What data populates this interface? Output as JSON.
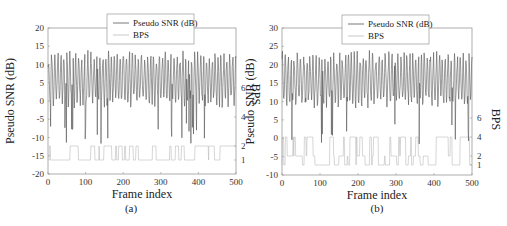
{
  "chart_data": [
    {
      "type": "line",
      "caption": "(a)",
      "xlabel": "Frame index",
      "ylabel": "Pseudo SNR (dB)",
      "ylabel_right": "BPS",
      "xlim": [
        0,
        500
      ],
      "ylim": [
        -20,
        20
      ],
      "xticks": [
        0,
        100,
        200,
        300,
        400,
        500
      ],
      "yticks": [
        -20,
        -15,
        -10,
        -5,
        0,
        5,
        10,
        15,
        20
      ],
      "yticks_right": [
        1,
        2,
        4,
        6
      ],
      "grid": false,
      "legend": {
        "position": "top-center",
        "entries": [
          "Pseudo SNR (dB)",
          "BPS"
        ]
      },
      "series": [
        {
          "name": "Pseudo SNR (dB)",
          "color": "#555555",
          "range": [
            -12,
            16
          ],
          "mean": 6
        },
        {
          "name": "BPS",
          "color": "#bbbbbb",
          "values_set": [
            1,
            2
          ],
          "note": "mostly 1, occasional bursts to 2"
        }
      ]
    },
    {
      "type": "line",
      "caption": "(b)",
      "xlabel": "Frame index",
      "ylabel": "Pseudo SNR (dB)",
      "ylabel_right": "BPS",
      "xlim": [
        0,
        500
      ],
      "ylim": [
        -10,
        30
      ],
      "xticks": [
        0,
        100,
        200,
        300,
        400,
        500
      ],
      "yticks": [
        -10,
        -5,
        0,
        5,
        10,
        15,
        20,
        25,
        30
      ],
      "yticks_right": [
        1,
        2,
        4,
        6
      ],
      "grid": false,
      "legend": {
        "position": "top-center",
        "entries": [
          "Pseudo SNR (dB)",
          "BPS"
        ]
      },
      "series": [
        {
          "name": "Pseudo SNR (dB)",
          "color": "#555555",
          "range": [
            -2,
            26
          ],
          "mean": 16
        },
        {
          "name": "BPS",
          "color": "#bbbbbb",
          "values_set": [
            1,
            2,
            4
          ],
          "note": "frequently switching between 1, 2 and 4"
        }
      ]
    }
  ]
}
